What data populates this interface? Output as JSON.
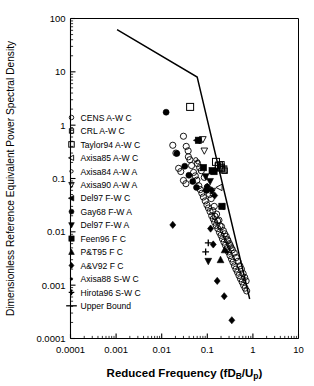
{
  "chart_data": {
    "type": "scatter",
    "title": "",
    "xlabel": "Reduced Frequency (fD_B/U_p)",
    "xlabel_parts": {
      "pre": "Reduced Frequency (f",
      "sub1": "B",
      "mid": "D",
      "div": "/U",
      "sub2": "p",
      "post": ")"
    },
    "ylabel": "Dimensionless Reference Equivalent Power Spectral Density",
    "xscale": "log",
    "yscale": "log",
    "xlim": [
      0.0001,
      10
    ],
    "ylim": [
      0.0001,
      100
    ],
    "xticks": [
      "0.0001",
      "0.001",
      "0.01",
      "0.1",
      "1",
      "10"
    ],
    "xtick_values": [
      0.0001,
      0.001,
      0.01,
      0.1,
      1,
      10
    ],
    "yticks": [
      "0.0001",
      "0.001",
      "0.01",
      "0.1",
      "1",
      "10",
      "100"
    ],
    "ytick_values": [
      0.0001,
      0.001,
      0.01,
      0.1,
      1,
      10,
      100
    ],
    "grid": false,
    "minor_ticks": true,
    "legend_position": "left-inside",
    "series": [
      {
        "name": "CENS A-W C",
        "marker": "circle-open",
        "points": [
          [
            0.0175,
            0.42
          ],
          [
            0.0205,
            0.3
          ],
          [
            0.0235,
            0.155
          ],
          [
            0.0262,
            0.135
          ],
          [
            0.03,
            0.092
          ],
          [
            0.034,
            0.08
          ],
          [
            0.0385,
            0.255
          ],
          [
            0.03,
            0.62
          ],
          [
            0.0345,
            0.4
          ],
          [
            0.038,
            0.33
          ],
          [
            0.0415,
            0.225
          ],
          [
            0.0452,
            0.175
          ],
          [
            0.05,
            0.13
          ],
          [
            0.0545,
            0.112
          ],
          [
            0.059,
            0.093
          ],
          [
            0.065,
            0.073
          ],
          [
            0.07,
            0.062
          ],
          [
            0.076,
            0.053
          ],
          [
            0.082,
            0.045
          ],
          [
            0.09,
            0.038
          ],
          [
            0.098,
            0.032
          ],
          [
            0.106,
            0.028
          ],
          [
            0.115,
            0.024
          ],
          [
            0.125,
            0.02
          ],
          [
            0.135,
            0.0175
          ],
          [
            0.145,
            0.0152
          ],
          [
            0.157,
            0.0132
          ],
          [
            0.17,
            0.0115
          ],
          [
            0.185,
            0.0098
          ],
          [
            0.2,
            0.0086
          ],
          [
            0.215,
            0.0074
          ],
          [
            0.232,
            0.0064
          ],
          [
            0.25,
            0.0056
          ],
          [
            0.27,
            0.0048
          ],
          [
            0.29,
            0.0042
          ],
          [
            0.315,
            0.0036
          ],
          [
            0.34,
            0.0031
          ],
          [
            0.365,
            0.0027
          ],
          [
            0.395,
            0.0023
          ],
          [
            0.425,
            0.002
          ],
          [
            0.46,
            0.00175
          ],
          [
            0.495,
            0.00152
          ],
          [
            0.535,
            0.00132
          ],
          [
            0.58,
            0.00115
          ],
          [
            0.625,
            0.001
          ],
          [
            0.675,
            0.00088
          ],
          [
            0.73,
            0.00078
          ],
          [
            0.061,
            0.19
          ],
          [
            0.068,
            0.16
          ],
          [
            0.074,
            0.14
          ],
          [
            0.086,
            0.105
          ],
          [
            0.1,
            0.068
          ],
          [
            0.112,
            0.05
          ],
          [
            0.122,
            0.042
          ],
          [
            0.142,
            0.03
          ],
          [
            0.16,
            0.0215
          ],
          [
            0.18,
            0.0165
          ],
          [
            0.205,
            0.0125
          ],
          [
            0.225,
            0.0105
          ],
          [
            0.26,
            0.0082
          ],
          [
            0.285,
            0.0068
          ],
          [
            0.32,
            0.0055
          ],
          [
            0.355,
            0.0046
          ],
          [
            0.39,
            0.004
          ],
          [
            0.43,
            0.0033
          ],
          [
            0.47,
            0.0028
          ],
          [
            0.52,
            0.0023
          ],
          [
            0.56,
            0.002
          ],
          [
            0.61,
            0.00165
          ],
          [
            0.66,
            0.0014
          ],
          [
            0.71,
            0.0012
          ],
          [
            0.132,
            0.025
          ],
          [
            0.148,
            0.0195
          ],
          [
            0.168,
            0.016
          ],
          [
            0.19,
            0.013
          ],
          [
            0.24,
            0.0092
          ],
          [
            0.275,
            0.0072
          ],
          [
            0.305,
            0.006
          ],
          [
            0.335,
            0.005
          ]
        ]
      },
      {
        "name": "CRL A-W C",
        "marker": "square-open",
        "points": [
          [
            0.17,
            0.175
          ],
          [
            0.195,
            0.16
          ],
          [
            0.215,
            0.15
          ],
          [
            0.24,
            0.14
          ],
          [
            0.205,
            0.185
          ]
        ]
      },
      {
        "name": "Taylor94 A-W C",
        "marker": "square-open-large",
        "points": [
          [
            0.042,
            2.2
          ],
          [
            0.155,
            0.205
          ],
          [
            0.182,
            0.175
          ],
          [
            0.2,
            0.16
          ],
          [
            0.225,
            0.148
          ]
        ]
      },
      {
        "name": "Axisa85 A-W C",
        "marker": "triangle-left-open",
        "points": [
          [
            0.205,
            0.03
          ],
          [
            0.185,
            0.068
          ]
        ]
      },
      {
        "name": "Axisa84 A-W A",
        "marker": "circle-open-small",
        "points": [
          [
            0.056,
            0.225
          ],
          [
            0.062,
            0.205
          ],
          [
            0.098,
            0.072
          ],
          [
            0.105,
            0.065
          ],
          [
            0.115,
            0.058
          ],
          [
            0.13,
            0.05
          ]
        ]
      },
      {
        "name": "Axisa90 A-W A",
        "marker": "triangle-down-open",
        "points": [
          [
            0.08,
            0.54
          ],
          [
            0.086,
            0.33
          ],
          [
            0.128,
            0.058
          ]
        ]
      },
      {
        "name": "Del97 F-W C",
        "marker": "triangle-left-filled",
        "points": [
          [
            0.06,
            0.52
          ]
        ]
      },
      {
        "name": "Gay68 F-W A",
        "marker": "circle-filled",
        "points": [
          [
            0.0125,
            1.75
          ],
          [
            0.0215,
            0.295
          ],
          [
            0.032,
            0.17
          ],
          [
            0.0395,
            0.115
          ],
          [
            0.048,
            0.088
          ],
          [
            0.058,
            0.068
          ],
          [
            0.095,
            0.06
          ]
        ]
      },
      {
        "name": "Del97 F-W A",
        "marker": "triangle-down-filled",
        "points": [
          [
            0.092,
            0.108
          ],
          [
            0.115,
            0.088
          ],
          [
            0.105,
            0.0028
          ]
        ]
      },
      {
        "name": "Feen96 F C",
        "marker": "square-filled",
        "points": [
          [
            0.064,
            0.52
          ],
          [
            0.128,
            0.14
          ],
          [
            0.14,
            0.135
          ],
          [
            0.21,
            0.03
          ],
          [
            0.082,
            0.16
          ]
        ]
      },
      {
        "name": "P&T95 F C",
        "marker": "triangle-up-filled",
        "points": [
          [
            0.195,
            0.003
          ],
          [
            0.24,
            0.0046
          ]
        ]
      },
      {
        "name": "A&V92 F C",
        "marker": "diamond-filled",
        "points": [
          [
            0.0175,
            0.0135
          ],
          [
            0.118,
            0.0115
          ],
          [
            0.135,
            0.0058
          ],
          [
            0.165,
            0.0012
          ],
          [
            0.235,
            0.00062
          ],
          [
            0.345,
            0.00022
          ],
          [
            0.1,
            0.07
          ],
          [
            0.125,
            0.06
          ],
          [
            0.145,
            0.048
          ]
        ]
      },
      {
        "name": "Axisa88 S-W C",
        "marker": "dot-small",
        "points": [
          [
            0.255,
            0.0045
          ],
          [
            0.275,
            0.0042
          ]
        ]
      },
      {
        "name": "Hirota96 S-W C",
        "marker": "plus",
        "points": [
          [
            0.105,
            0.0062
          ],
          [
            0.092,
            0.0042
          ]
        ]
      }
    ],
    "upper_bound": {
      "label": "Upper Bound",
      "marker": "line",
      "points": [
        [
          0.00105,
          62.0
        ],
        [
          0.06,
          8.0
        ],
        [
          0.85,
          0.00055
        ]
      ]
    }
  },
  "legend": {
    "items": [
      {
        "label": "CENS A-W C",
        "marker": "circle-open"
      },
      {
        "label": "CRL A-W C",
        "marker": "square-open"
      },
      {
        "label": "Taylor94 A-W C",
        "marker": "square-open-large"
      },
      {
        "label": "Axisa85 A-W C",
        "marker": "triangle-left-open"
      },
      {
        "label": "Axisa84 A-W A",
        "marker": "circle-open-small"
      },
      {
        "label": "Axisa90 A-W A",
        "marker": "triangle-down-open"
      },
      {
        "label": "Del97 F-W C",
        "marker": "triangle-left-filled"
      },
      {
        "label": "Gay68 F-W A",
        "marker": "circle-filled"
      },
      {
        "label": "Del97 F-W A",
        "marker": "triangle-down-filled"
      },
      {
        "label": "Feen96 F C",
        "marker": "square-filled"
      },
      {
        "label": "P&T95 F C",
        "marker": "triangle-up-filled"
      },
      {
        "label": "A&V92 F C",
        "marker": "diamond-filled"
      },
      {
        "label": "Axisa88 S-W C",
        "marker": "dot-small"
      },
      {
        "label": "Hirota96 S-W C",
        "marker": "plus"
      },
      {
        "label": "Upper Bound",
        "marker": "line"
      }
    ]
  },
  "style": {
    "axis_color": "#000000",
    "marker_color": "#000000",
    "background": "#ffffff"
  }
}
